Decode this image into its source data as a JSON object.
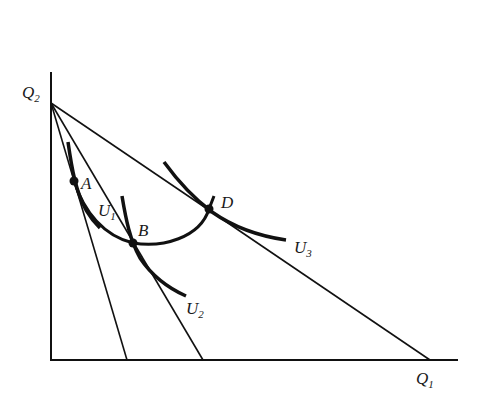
{
  "diagram": {
    "type": "indifference-curves-budget-lines",
    "axes": {
      "y_label": "Q",
      "y_sub": "2",
      "x_label": "Q",
      "x_sub": "1"
    },
    "points": [
      {
        "name": "A",
        "x": 74,
        "y": 181
      },
      {
        "name": "B",
        "x": 133,
        "y": 243
      },
      {
        "name": "D",
        "x": 209,
        "y": 209
      }
    ],
    "curves": [
      {
        "label": "U",
        "sub": "1"
      },
      {
        "label": "U",
        "sub": "2"
      },
      {
        "label": "U",
        "sub": "3"
      }
    ],
    "colors": {
      "ink": "#111111",
      "background": "#ffffff"
    }
  }
}
